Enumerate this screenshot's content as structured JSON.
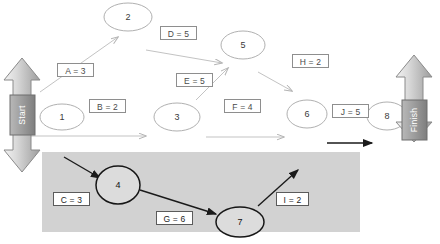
{
  "diagram": {
    "type": "activity-on-arrow-network",
    "background_color": "#ffffff",
    "highlight_region": {
      "name": "critical-path-highlight",
      "color": "#d0d0d0",
      "x": 42,
      "y": 152,
      "width": 318,
      "height": 80
    },
    "terminals": [
      {
        "id": "start",
        "label": "Start",
        "x": 22,
        "y": 112,
        "color": "#9a9a9a"
      },
      {
        "id": "finish",
        "label": "Finish",
        "x": 414,
        "y": 112,
        "color": "#9a9a9a"
      }
    ],
    "nodes": [
      {
        "id": "n1",
        "label": "1",
        "x": 62,
        "y": 117,
        "rx": 22,
        "ry": 13,
        "emphasis": "light"
      },
      {
        "id": "n2",
        "label": "2",
        "x": 128,
        "y": 17,
        "rx": 24,
        "ry": 14,
        "emphasis": "light"
      },
      {
        "id": "n3",
        "label": "3",
        "x": 177,
        "y": 117,
        "rx": 23,
        "ry": 14,
        "emphasis": "light"
      },
      {
        "id": "n4",
        "label": "4",
        "x": 118,
        "y": 185,
        "rx": 22,
        "ry": 19,
        "emphasis": "dark"
      },
      {
        "id": "n5",
        "label": "5",
        "x": 243,
        "y": 45,
        "rx": 22,
        "ry": 14,
        "emphasis": "light"
      },
      {
        "id": "n6",
        "label": "6",
        "x": 307,
        "y": 114,
        "rx": 20,
        "ry": 14,
        "emphasis": "light"
      },
      {
        "id": "n7",
        "label": "7",
        "x": 240,
        "y": 222,
        "rx": 24,
        "ry": 15,
        "emphasis": "dark"
      },
      {
        "id": "n8",
        "label": "8",
        "x": 387,
        "y": 116,
        "rx": 20,
        "ry": 14,
        "emphasis": "light"
      }
    ],
    "edges": [
      {
        "id": "A",
        "label": "A = 3",
        "from": "n1",
        "to": "n2",
        "duration": 3,
        "box_x": 57,
        "box_y": 63,
        "box_w": 37,
        "emphasis": "light"
      },
      {
        "id": "B",
        "label": "B = 2",
        "from": "n1",
        "to": "n3",
        "duration": 2,
        "box_x": 89,
        "box_y": 99,
        "box_w": 37,
        "emphasis": "light"
      },
      {
        "id": "C",
        "label": "C = 3",
        "from": "n1",
        "to": "n4",
        "duration": 3,
        "box_x": 53,
        "box_y": 192,
        "box_w": 37,
        "emphasis": "dark"
      },
      {
        "id": "D",
        "label": "D = 5",
        "from": "n2",
        "to": "n5",
        "duration": 5,
        "box_x": 160,
        "box_y": 26,
        "box_w": 37,
        "emphasis": "light"
      },
      {
        "id": "E",
        "label": "E = 5",
        "from": "n3",
        "to": "n5",
        "duration": 5,
        "box_x": 176,
        "box_y": 73,
        "box_w": 37,
        "emphasis": "light"
      },
      {
        "id": "F",
        "label": "F = 4",
        "from": "n3",
        "to": "n6",
        "duration": 4,
        "box_x": 224,
        "box_y": 99,
        "box_w": 37,
        "emphasis": "light"
      },
      {
        "id": "G",
        "label": "G = 6",
        "from": "n4",
        "to": "n7",
        "duration": 6,
        "box_x": 156,
        "box_y": 211,
        "box_w": 37,
        "emphasis": "dark"
      },
      {
        "id": "H",
        "label": "H = 2",
        "from": "n5",
        "to": "n6",
        "duration": 2,
        "box_x": 292,
        "box_y": 54,
        "box_w": 37,
        "emphasis": "light"
      },
      {
        "id": "I",
        "label": "I = 2",
        "from": "n7",
        "to": "n8",
        "duration": 2,
        "box_x": 276,
        "box_y": 192,
        "box_w": 33,
        "emphasis": "dark"
      },
      {
        "id": "J",
        "label": "J = 5",
        "from": "n6",
        "to": "n8",
        "duration": 5,
        "box_x": 332,
        "box_y": 104,
        "box_w": 37,
        "emphasis": "light"
      }
    ]
  }
}
